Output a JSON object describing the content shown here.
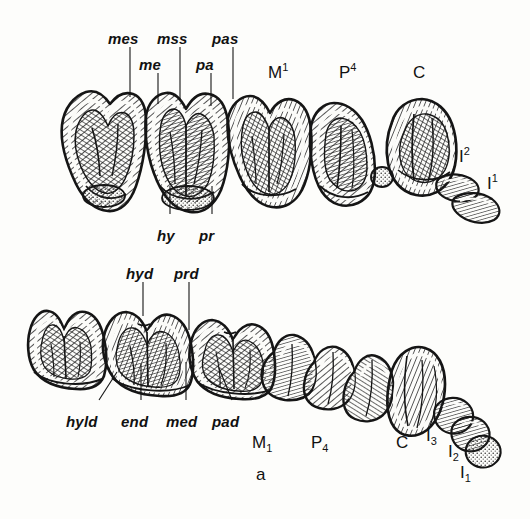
{
  "figure": {
    "caption": "a",
    "background_color": "#fdfdfb",
    "ink_color": "#151515"
  },
  "upper_row": {
    "cusp_labels": [
      {
        "id": "mes",
        "text": "mes",
        "x": 108,
        "y": 31,
        "leader_x": 130,
        "leader_y0": 47,
        "leader_y1": 97
      },
      {
        "id": "me",
        "text": "me",
        "x": 139,
        "y": 57,
        "leader_x": 158,
        "leader_y0": 73,
        "leader_y1": 104
      },
      {
        "id": "mss",
        "text": "mss",
        "x": 157,
        "y": 31,
        "leader_x": 180,
        "leader_y0": 47,
        "leader_y1": 100
      },
      {
        "id": "pa",
        "text": "pa",
        "x": 196,
        "y": 57,
        "leader_x": 211,
        "leader_y0": 73,
        "leader_y1": 106
      },
      {
        "id": "pas",
        "text": "pas",
        "x": 212,
        "y": 31,
        "leader_x": 233,
        "leader_y0": 47,
        "leader_y1": 99
      }
    ],
    "lower_cusp_labels": [
      {
        "id": "hy",
        "text": "hy",
        "x": 157,
        "y": 228,
        "leader_x": 170,
        "leader_y0": 186,
        "leader_y1": 214
      },
      {
        "id": "pr",
        "text": "pr",
        "x": 199,
        "y": 228,
        "leader_x": 212,
        "leader_y0": 186,
        "leader_y1": 214
      }
    ],
    "tooth_labels": [
      {
        "id": "M1",
        "base": "M",
        "index": "1",
        "position": "super",
        "x": 268,
        "y": 64
      },
      {
        "id": "P4",
        "base": "P",
        "index": "4",
        "position": "super",
        "x": 339,
        "y": 64
      },
      {
        "id": "C",
        "base": "C",
        "index": "",
        "position": "none",
        "x": 413,
        "y": 64
      },
      {
        "id": "I2",
        "base": "I",
        "index": "2",
        "position": "super",
        "x": 459,
        "y": 148
      },
      {
        "id": "I1",
        "base": "I",
        "index": "1",
        "position": "super",
        "x": 487,
        "y": 175
      }
    ]
  },
  "lower_row": {
    "cusp_labels_top": [
      {
        "id": "hyd",
        "text": "hyd",
        "x": 126,
        "y": 266,
        "leader_x": 143,
        "leader_y0": 282,
        "leader_y1": 316
      },
      {
        "id": "prd",
        "text": "prd",
        "x": 174,
        "y": 266,
        "leader_x": 189,
        "leader_y0": 282,
        "leader_y1": 330
      }
    ],
    "cusp_labels_bottom": [
      {
        "id": "hyld",
        "text": "hyld",
        "x": 66,
        "y": 414,
        "leader_x1": 99,
        "leader_y1": 400,
        "leader_x2": 117,
        "leader_y2": 372
      },
      {
        "id": "end",
        "text": "end",
        "x": 121,
        "y": 414,
        "leader_x1": 141,
        "leader_y1": 400,
        "leader_x2": 141,
        "leader_y2": 364
      },
      {
        "id": "med",
        "text": "med",
        "x": 166,
        "y": 414,
        "leader_x1": 186,
        "leader_y1": 400,
        "leader_x2": 186,
        "leader_y2": 362
      },
      {
        "id": "pad",
        "text": "pad",
        "x": 212,
        "y": 414,
        "leader_x1": 232,
        "leader_y1": 400,
        "leader_x2": 219,
        "leader_y2": 368
      }
    ],
    "tooth_labels": [
      {
        "id": "M1",
        "base": "M",
        "index": "1",
        "position": "sub",
        "x": 252,
        "y": 434
      },
      {
        "id": "P4",
        "base": "P",
        "index": "4",
        "position": "sub",
        "x": 311,
        "y": 434
      },
      {
        "id": "C",
        "base": "C",
        "index": "",
        "position": "none",
        "x": 396,
        "y": 434
      },
      {
        "id": "I3",
        "base": "I",
        "index": "3",
        "position": "sub",
        "x": 426,
        "y": 427
      },
      {
        "id": "I2",
        "base": "I",
        "index": "2",
        "position": "sub",
        "x": 448,
        "y": 443
      },
      {
        "id": "I1",
        "base": "I",
        "index": "1",
        "position": "sub",
        "x": 460,
        "y": 464
      }
    ]
  }
}
